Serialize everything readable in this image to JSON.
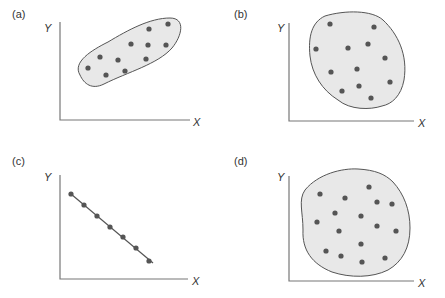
{
  "chart_data": [
    {
      "type": "scatter",
      "panel": "(a)",
      "xlabel": "X",
      "ylabel": "Y",
      "description": "Positive correlation – points inside an elongated tilted ellipse",
      "points": [
        [
          88,
          68
        ],
        [
          100,
          57
        ],
        [
          106,
          75
        ],
        [
          118,
          60
        ],
        [
          125,
          71
        ],
        [
          131,
          44
        ],
        [
          149,
          29
        ],
        [
          148,
          45
        ],
        [
          146,
          59
        ],
        [
          166,
          45
        ],
        [
          168,
          24
        ]
      ]
    },
    {
      "type": "scatter",
      "panel": "(b)",
      "xlabel": "X",
      "ylabel": "Y",
      "description": "No correlation – points scattered inside an irregular rounded blob",
      "points": [
        [
          330,
          24
        ],
        [
          316,
          49
        ],
        [
          348,
          48
        ],
        [
          368,
          44
        ],
        [
          374,
          27
        ],
        [
          385,
          58
        ],
        [
          331,
          72
        ],
        [
          357,
          69
        ],
        [
          390,
          82
        ],
        [
          342,
          91
        ],
        [
          359,
          86
        ],
        [
          371,
          98
        ]
      ]
    },
    {
      "type": "scatter",
      "panel": "(c)",
      "xlabel": "X",
      "ylabel": "Y",
      "description": "Perfect negative correlation – points lie exactly on a straight descending line",
      "points": [
        [
          71,
          194
        ],
        [
          84,
          205
        ],
        [
          97,
          216
        ],
        [
          110,
          227
        ],
        [
          123,
          237
        ],
        [
          136,
          248
        ],
        [
          149,
          261
        ]
      ]
    },
    {
      "type": "scatter",
      "panel": "(d)",
      "xlabel": "X",
      "ylabel": "Y",
      "description": "No correlation – points scattered inside a roughly circular blob",
      "points": [
        [
          320,
          194
        ],
        [
          345,
          198
        ],
        [
          369,
          187
        ],
        [
          377,
          202
        ],
        [
          392,
          204
        ],
        [
          335,
          213
        ],
        [
          361,
          216
        ],
        [
          317,
          222
        ],
        [
          339,
          231
        ],
        [
          377,
          226
        ],
        [
          396,
          231
        ],
        [
          361,
          244
        ],
        [
          326,
          251
        ],
        [
          341,
          256
        ],
        [
          362,
          262
        ],
        [
          385,
          258
        ]
      ]
    }
  ],
  "panels": {
    "a": {
      "label": "(a)",
      "x_axis": "X",
      "y_axis": "Y"
    },
    "b": {
      "label": "(b)",
      "x_axis": "X",
      "y_axis": "Y"
    },
    "c": {
      "label": "(c)",
      "x_axis": "X",
      "y_axis": "Y"
    },
    "d": {
      "label": "(d)",
      "x_axis": "X",
      "y_axis": "Y"
    }
  },
  "colors": {
    "axis": "#777777",
    "blob_fill": "#e8e8e8",
    "blob_stroke": "#555555",
    "point": "#555555",
    "line": "#555555"
  }
}
